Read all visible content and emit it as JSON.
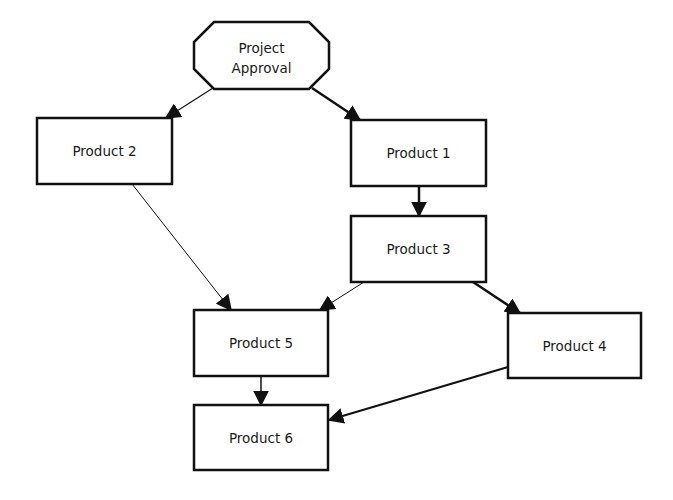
{
  "diagram": {
    "type": "flowchart",
    "colors": {
      "stroke": "#111111",
      "fill": "#ffffff",
      "text": "#1a1a1a",
      "background": "#ffffff"
    },
    "nodes": [
      {
        "id": "approval",
        "shape": "octagon",
        "lines": [
          "Project",
          "Approval"
        ],
        "x": 194,
        "y": 22,
        "w": 135,
        "h": 67
      },
      {
        "id": "p2",
        "shape": "rect",
        "label": "Product 2",
        "x": 37,
        "y": 118,
        "w": 135,
        "h": 66
      },
      {
        "id": "p1",
        "shape": "rect",
        "label": "Product 1",
        "x": 351,
        "y": 120,
        "w": 135,
        "h": 66
      },
      {
        "id": "p3",
        "shape": "rect",
        "label": "Product 3",
        "x": 351,
        "y": 216,
        "w": 135,
        "h": 66
      },
      {
        "id": "p5",
        "shape": "rect",
        "label": "Product 5",
        "x": 194,
        "y": 310,
        "w": 134,
        "h": 66
      },
      {
        "id": "p4",
        "shape": "rect",
        "label": "Product 4",
        "x": 508,
        "y": 313,
        "w": 133,
        "h": 65
      },
      {
        "id": "p6",
        "shape": "rect",
        "label": "Product 6",
        "x": 194,
        "y": 405,
        "w": 134,
        "h": 65
      }
    ],
    "edges": [
      {
        "from": "approval",
        "to": "p2",
        "x1": 213,
        "y1": 88,
        "x2": 166,
        "y2": 118,
        "width": 1.2
      },
      {
        "from": "approval",
        "to": "p1",
        "x1": 312,
        "y1": 88,
        "x2": 360,
        "y2": 120,
        "width": 2.5
      },
      {
        "from": "p1",
        "to": "p3",
        "x1": 419,
        "y1": 186,
        "x2": 419,
        "y2": 216,
        "width": 2.5
      },
      {
        "from": "p2",
        "to": "p5",
        "x1": 132,
        "y1": 184,
        "x2": 231,
        "y2": 310,
        "width": 1.0
      },
      {
        "from": "p3",
        "to": "p5",
        "x1": 364,
        "y1": 282,
        "x2": 320,
        "y2": 310,
        "width": 1.0
      },
      {
        "from": "p3",
        "to": "p4",
        "x1": 473,
        "y1": 282,
        "x2": 520,
        "y2": 313,
        "width": 2.5
      },
      {
        "from": "p5",
        "to": "p6",
        "x1": 261,
        "y1": 376,
        "x2": 261,
        "y2": 405,
        "width": 1.5
      },
      {
        "from": "p4",
        "to": "p6",
        "x1": 508,
        "y1": 367,
        "x2": 329,
        "y2": 420,
        "width": 2.2
      }
    ]
  }
}
